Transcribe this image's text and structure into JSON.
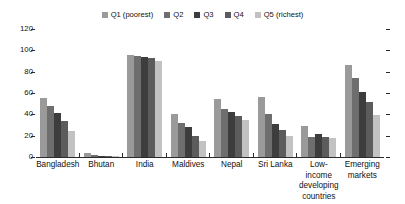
{
  "chart_data": {
    "type": "bar",
    "title": "",
    "subtitle": "",
    "xlabel": "",
    "ylabel": "",
    "ylim": [
      0,
      120
    ],
    "yticks": [
      0,
      20,
      40,
      60,
      80,
      100,
      120
    ],
    "grid": false,
    "legend_position": "top-center",
    "categories": [
      "Bangladesh",
      "Bhutan",
      "India",
      "Maldives",
      "Nepal",
      "Sri Lanka",
      "Low-income developing countries",
      "Emerging markets"
    ],
    "category_lines": [
      [
        "Bangladesh"
      ],
      [
        "Bhutan"
      ],
      [
        "India"
      ],
      [
        "Maldives"
      ],
      [
        "Nepal"
      ],
      [
        "Sri Lanka"
      ],
      [
        "Low-income",
        "developing",
        "countries"
      ],
      [
        "Emerging",
        "markets"
      ]
    ],
    "series": [
      {
        "name": "Q1 (poorest)",
        "color": "#9a9a9a",
        "values": [
          55,
          4,
          96,
          40,
          54,
          56,
          29,
          86
        ]
      },
      {
        "name": "Q2",
        "color": "#6e6e6e",
        "values": [
          48,
          2,
          95,
          32,
          45,
          40,
          19,
          74
        ]
      },
      {
        "name": "Q3",
        "color": "#3d3d3d",
        "values": [
          41,
          1,
          94,
          28,
          42,
          31,
          22,
          61
        ]
      },
      {
        "name": "Q4",
        "color": "#5c5c5c",
        "values": [
          34,
          1,
          93,
          20,
          38,
          25,
          19,
          52
        ]
      },
      {
        "name": "Q5 (richest)",
        "color": "#c2c2c2",
        "values": [
          24,
          1,
          90,
          15,
          35,
          20,
          18,
          39
        ]
      }
    ]
  },
  "axis": {
    "tick_labels": [
      "120",
      "100",
      "80",
      "60",
      "40",
      "20",
      "0"
    ],
    "max": 120
  },
  "colors": {
    "axis": "#2b2b2b",
    "text": "#111111",
    "background": "#ffffff"
  }
}
